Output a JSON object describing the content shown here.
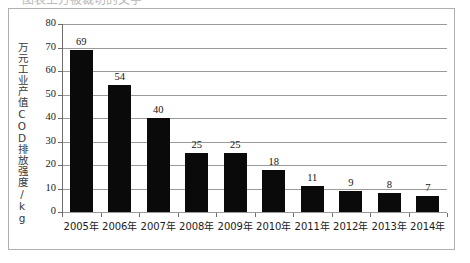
{
  "top_caption": {
    "text": "图表上方被裁切的文字",
    "note_visible": "partially cropped text row at top edge"
  },
  "chart_data": {
    "type": "bar",
    "title": "",
    "xlabel": "",
    "ylabel": "万元工业产值COD排放强度/kg",
    "categories": [
      "2005年",
      "2006年",
      "2007年",
      "2008年",
      "2009年",
      "2010年",
      "2011年",
      "2012年",
      "2013年",
      "2014年"
    ],
    "values": [
      69,
      54,
      40,
      25,
      25,
      18,
      11,
      9,
      8,
      7
    ],
    "value_labels": [
      "69",
      "54",
      "40",
      "25",
      "25",
      "18",
      "11",
      "9",
      "8",
      "7"
    ],
    "ylim": [
      0,
      80
    ],
    "ytick_values": [
      0,
      10,
      20,
      30,
      40,
      50,
      60,
      70,
      80
    ],
    "ytick_labels": [
      "0",
      "10",
      "20",
      "30",
      "40",
      "50",
      "60",
      "70",
      "80"
    ],
    "grid": true,
    "legend": null,
    "legend_position": "none",
    "series": [
      {
        "name": "万元工业产值COD排放强度",
        "values": [
          69,
          54,
          40,
          25,
          25,
          18,
          11,
          9,
          8,
          7
        ]
      }
    ],
    "colors": {
      "bar_fill": "#0a0a0a",
      "gridline": "#9a9a9a",
      "axis": "#6e6e6e",
      "frame": "#b0b0b0",
      "text": "#1a1a1a",
      "background": "#ffffff"
    }
  }
}
